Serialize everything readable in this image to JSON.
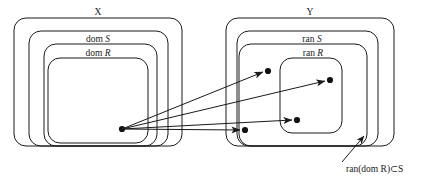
{
  "figure": {
    "kind": "set-relation-diagram",
    "background_color": "#ffffff",
    "stroke_color": "#1a1a1a",
    "dot_color": "#111111",
    "width": 427,
    "height": 180
  },
  "left_group": {
    "name": "domain-side",
    "boxes": [
      {
        "label": "X",
        "label_plain": "X",
        "label_italic": "",
        "x": 14,
        "y": 18,
        "w": 168,
        "h": 128,
        "rx": 12
      },
      {
        "label": "dom S",
        "label_plain": "dom ",
        "label_italic": "S",
        "x": 29,
        "y": 31,
        "w": 139,
        "h": 115,
        "rx": 12
      },
      {
        "label": "dom R",
        "label_plain": "dom ",
        "label_italic": "R",
        "x": 44,
        "y": 44,
        "w": 113,
        "h": 102,
        "rx": 12
      },
      {
        "label": "",
        "label_plain": "",
        "label_italic": "",
        "x": 48,
        "y": 58,
        "w": 100,
        "h": 85,
        "rx": 12
      }
    ],
    "source_dot": {
      "name": "source-node",
      "cx": 122,
      "cy": 129,
      "r": 3.1
    }
  },
  "right_group": {
    "name": "range-side",
    "boxes": [
      {
        "label": "Y",
        "label_plain": "Y",
        "label_italic": "",
        "x": 226,
        "y": 18,
        "w": 168,
        "h": 128,
        "rx": 12
      },
      {
        "label": "ran S",
        "label_plain": "ran ",
        "label_italic": "S",
        "x": 237,
        "y": 31,
        "w": 141,
        "h": 115,
        "rx": 12
      },
      {
        "label": "ran R",
        "label_plain": "ran ",
        "label_italic": "R",
        "x": 239,
        "y": 44,
        "w": 128,
        "h": 102,
        "rx": 12
      },
      {
        "label": "",
        "label_plain": "",
        "label_italic": "",
        "x": 280,
        "y": 58,
        "w": 62,
        "h": 75,
        "rx": 12
      }
    ],
    "target_dots": [
      {
        "name": "target-node-1",
        "cx": 268,
        "cy": 71,
        "r": 3.1
      },
      {
        "name": "target-node-2",
        "cx": 330,
        "cy": 80,
        "r": 3.1
      },
      {
        "name": "target-node-3",
        "cx": 297,
        "cy": 120,
        "r": 3.1
      },
      {
        "name": "target-node-4",
        "cx": 245,
        "cy": 130,
        "r": 3.1
      }
    ]
  },
  "arrows": [
    {
      "name": "arrow-to-target-1",
      "x1": 122,
      "y1": 129,
      "x2": 263,
      "y2": 72
    },
    {
      "name": "arrow-to-target-2",
      "x1": 122,
      "y1": 129,
      "x2": 325,
      "y2": 81
    },
    {
      "name": "arrow-to-target-3",
      "x1": 122,
      "y1": 129,
      "x2": 292,
      "y2": 120
    },
    {
      "name": "arrow-to-target-4",
      "x1": 122,
      "y1": 129,
      "x2": 240,
      "y2": 130
    }
  ],
  "annotation": {
    "name": "ran-dom-r-subset-s",
    "text": "ran(dom R)⊂S",
    "text_prefix": "ran(dom ",
    "text_italic_1": "R",
    "text_middle": ")⊂",
    "text_italic_2": "S",
    "text_x": 346,
    "text_y": 172,
    "leader": {
      "x1": 342,
      "y1": 162,
      "x2": 364,
      "y2": 136
    }
  }
}
